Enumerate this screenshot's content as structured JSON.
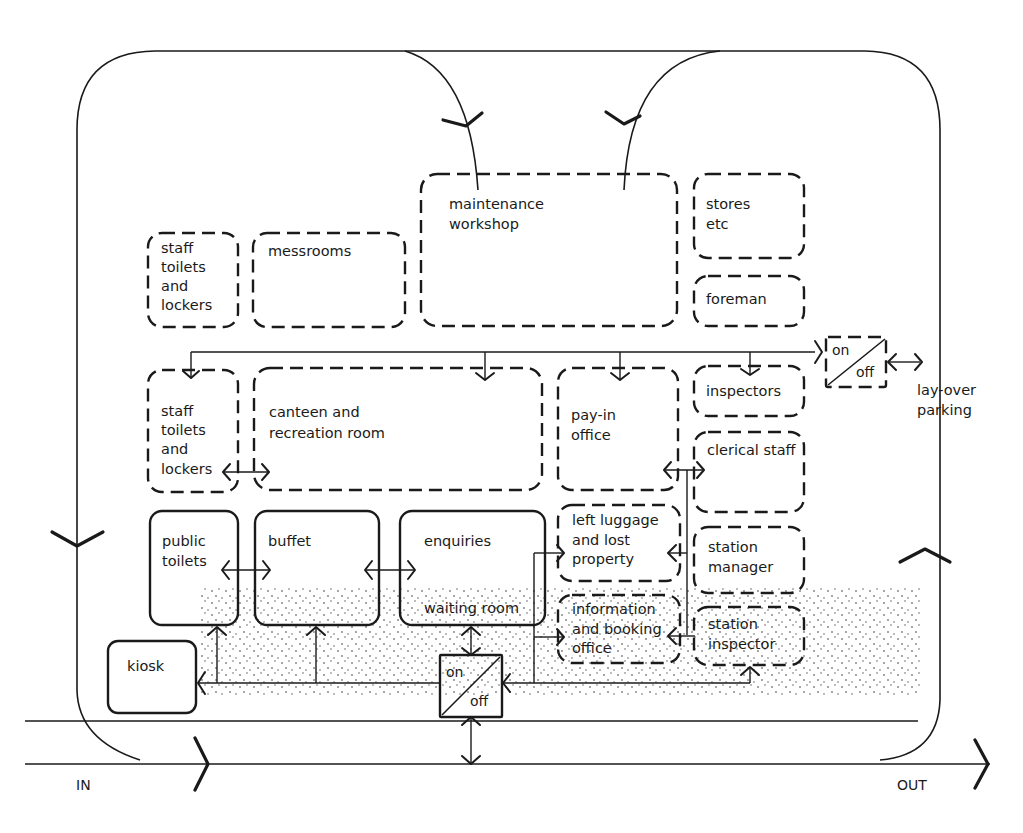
{
  "diagram": {
    "rooms": {
      "staff_toilets_top": [
        "staff",
        "toilets",
        "and",
        "lockers"
      ],
      "messrooms": [
        "messrooms"
      ],
      "maintenance_workshop": [
        "maintenance",
        "workshop"
      ],
      "stores": [
        "stores",
        "etc"
      ],
      "foreman": [
        "foreman"
      ],
      "staff_toilets_mid": [
        "staff",
        "toilets",
        "and",
        "lockers"
      ],
      "canteen": [
        "canteen and",
        "recreation room"
      ],
      "pay_in_office": [
        "pay-in",
        "office"
      ],
      "inspectors": [
        "inspectors"
      ],
      "clerical_staff": [
        "clerical staff"
      ],
      "public_toilets": [
        "public",
        "toilets"
      ],
      "buffet": [
        "buffet"
      ],
      "enquiries": [
        "enquiries"
      ],
      "waiting_room": [
        "waiting room"
      ],
      "left_luggage": [
        "left luggage",
        "and lost",
        "property"
      ],
      "information_booking": [
        "information",
        "and booking",
        "office"
      ],
      "station_manager": [
        "station",
        "manager"
      ],
      "station_inspector": [
        "station",
        "inspector"
      ],
      "kiosk": [
        "kiosk"
      ]
    },
    "switches": {
      "staff_switch": {
        "on": "on",
        "off": "off"
      },
      "public_switch": {
        "on": "on",
        "off": "off"
      }
    },
    "external": {
      "layover": [
        "lay-over",
        "parking"
      ],
      "in_label": "IN",
      "out_label": "OUT"
    },
    "legend": {
      "solid_outline": "public areas",
      "dashed_outline": "staff areas",
      "stipple": "concourse"
    }
  }
}
